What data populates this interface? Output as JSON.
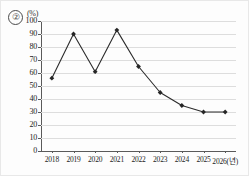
{
  "figure": {
    "marker_label": "②",
    "unit_label": "(%)"
  },
  "chart_data": {
    "type": "line",
    "title": "",
    "subtitle": "",
    "xlabel": "(년)",
    "ylabel": "(%)",
    "categories": [
      "2018",
      "2019",
      "2020",
      "2021",
      "2022",
      "2023",
      "2024",
      "2025",
      "2026"
    ],
    "x_tick_labels": [
      "2018",
      "2019",
      "2020",
      "2021",
      "2022",
      "2023",
      "2024",
      "2025",
      "2026(년)"
    ],
    "values": [
      56,
      90,
      61,
      93,
      65,
      45,
      35,
      30,
      30
    ],
    "y_tick_labels": [
      "0",
      "10",
      "20",
      "30",
      "40",
      "50",
      "60",
      "70",
      "80",
      "90",
      "100"
    ],
    "y_ticks": [
      0,
      10,
      20,
      30,
      40,
      50,
      60,
      70,
      80,
      90,
      100
    ],
    "ylim": [
      0,
      100
    ],
    "grid": true,
    "legend": false,
    "legend_position": "none",
    "series": [
      {
        "name": "series-1",
        "values": [
          56,
          90,
          61,
          93,
          65,
          45,
          35,
          30,
          30
        ],
        "color": "#2b2b2b",
        "marker": "diamond"
      }
    ],
    "colors": {
      "line": "#2b2b2b",
      "marker": "#262626",
      "gridline": "#dddddd",
      "axis": "#5a5a5a",
      "background": "#fdfdfd",
      "text": "#222222"
    }
  }
}
